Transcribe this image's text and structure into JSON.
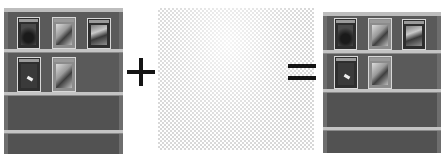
{
  "diagram": {
    "type": "image-composition-equation",
    "operands": [
      {
        "id": "left-shelf",
        "kind": "image",
        "subject": "bookshelf with magazines"
      },
      {
        "id": "transparent-layer",
        "kind": "transparency-checkerboard"
      },
      {
        "id": "result-shelf",
        "kind": "image",
        "subject": "bookshelf with magazines"
      }
    ],
    "operators": {
      "plus": "+",
      "equals": "="
    },
    "shelf": {
      "shelves": 4,
      "row1_books": [
        "dark-cover",
        "light-cover",
        "mixed-cover"
      ],
      "row2_books": [
        "bone-cover",
        "mixed-cover"
      ]
    },
    "colors": {
      "background": "#ffffff",
      "shelf_body": "#5d5d5d",
      "shelf_board": "#c4c4c4",
      "operator": "#141414",
      "checker": "#d8d8d8"
    }
  }
}
